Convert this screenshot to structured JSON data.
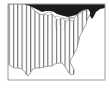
{
  "map": {
    "region": "eastern-united-states",
    "style": "vertical-hatching",
    "colors": {
      "background": "#ffffff",
      "frame": "#9a9a9a",
      "land_dark": "#1c1c1c",
      "hatch": "#6e6e6e",
      "coast": "#8a8a8a"
    },
    "layers": [
      {
        "name": "canada-landmass",
        "fill": "dark"
      },
      {
        "name": "us-hatched-region",
        "fill": "vertical-stripes"
      },
      {
        "name": "ocean",
        "fill": "white"
      }
    ]
  }
}
